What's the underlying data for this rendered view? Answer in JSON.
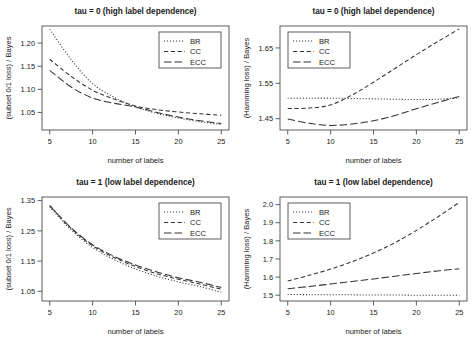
{
  "figure": {
    "series_names": [
      "BR",
      "CC",
      "ECC"
    ],
    "line_styles": {
      "BR": "dotted",
      "CC": "dashed",
      "ECC": "longdash"
    },
    "stroke_color": "#333333",
    "axis_color": "#4d4d4d",
    "background": "#ffffff"
  },
  "chart_data": [
    {
      "id": "panel-tl",
      "type": "line",
      "title": "tau = 0 (high label dependence)",
      "xlabel": "number of labels",
      "ylabel": "(subset 0/1 loss) / Bayes",
      "x": [
        5,
        7.5,
        10,
        12.5,
        15,
        17.5,
        20,
        22.5,
        25
      ],
      "xlim": [
        4.1,
        25.9
      ],
      "ylim": [
        1.012,
        1.237
      ],
      "xticks": [
        5,
        10,
        15,
        20,
        25
      ],
      "yticks": [
        1.05,
        1.1,
        1.15,
        1.2
      ],
      "ytick_labels": [
        "1.05",
        "1.10",
        "1.15",
        "1.20"
      ],
      "grid": false,
      "legend_position": "top-right",
      "series": [
        {
          "name": "BR",
          "values": [
            1.23,
            1.164,
            1.112,
            1.083,
            1.062,
            1.048,
            1.038,
            1.03,
            1.024
          ]
        },
        {
          "name": "CC",
          "values": [
            1.165,
            1.128,
            1.098,
            1.079,
            1.064,
            1.056,
            1.051,
            1.047,
            1.044
          ]
        },
        {
          "name": "ECC",
          "values": [
            1.141,
            1.105,
            1.081,
            1.07,
            1.062,
            1.05,
            1.04,
            1.032,
            1.026
          ]
        }
      ]
    },
    {
      "id": "panel-tr",
      "type": "line",
      "title": "tau = 0 (high label dependence)",
      "xlabel": "number of labels",
      "ylabel": "(Hamming loss) / Bayes",
      "x": [
        5,
        7.5,
        10,
        12.5,
        15,
        17.5,
        20,
        22.5,
        25
      ],
      "xlim": [
        4.1,
        25.9
      ],
      "ylim": [
        1.418,
        1.712
      ],
      "xticks": [
        5,
        10,
        15,
        20,
        25
      ],
      "yticks": [
        1.45,
        1.55,
        1.65
      ],
      "ytick_labels": [
        "1.45",
        "1.55",
        "1.65"
      ],
      "grid": false,
      "legend_position": "top-left",
      "series": [
        {
          "name": "BR",
          "values": [
            1.508,
            1.508,
            1.508,
            1.507,
            1.506,
            1.505,
            1.504,
            1.505,
            1.509
          ]
        },
        {
          "name": "CC",
          "values": [
            1.479,
            1.48,
            1.489,
            1.517,
            1.553,
            1.592,
            1.631,
            1.668,
            1.704
          ]
        },
        {
          "name": "ECC",
          "values": [
            1.449,
            1.437,
            1.431,
            1.435,
            1.444,
            1.459,
            1.478,
            1.496,
            1.513
          ]
        }
      ]
    },
    {
      "id": "panel-bl",
      "type": "line",
      "title": "tau = 1 (low label dependence)",
      "xlabel": "number of labels",
      "ylabel": "(subset 0/1 loss) / Bayes",
      "x": [
        5,
        7.5,
        10,
        12.5,
        15,
        17.5,
        20,
        22.5,
        25
      ],
      "xlim": [
        4.1,
        25.9
      ],
      "ylim": [
        1.018,
        1.362
      ],
      "xticks": [
        5,
        10,
        15,
        20,
        25
      ],
      "yticks": [
        1.05,
        1.15,
        1.25,
        1.35
      ],
      "ytick_labels": [
        "1.05",
        "1.15",
        "1.25",
        "1.35"
      ],
      "grid": false,
      "legend_position": "top-right",
      "series": [
        {
          "name": "BR",
          "values": [
            1.328,
            1.253,
            1.195,
            1.155,
            1.124,
            1.1,
            1.081,
            1.066,
            1.047
          ]
        },
        {
          "name": "CC",
          "values": [
            1.334,
            1.258,
            1.201,
            1.162,
            1.132,
            1.108,
            1.09,
            1.074,
            1.057
          ]
        },
        {
          "name": "ECC",
          "values": [
            1.333,
            1.26,
            1.204,
            1.166,
            1.137,
            1.114,
            1.095,
            1.08,
            1.063
          ]
        }
      ]
    },
    {
      "id": "panel-br",
      "type": "line",
      "title": "tau = 1 (low label dependence)",
      "xlabel": "number of labels",
      "ylabel": "(Hamming loss) / Bayes",
      "x": [
        5,
        7.5,
        10,
        12.5,
        15,
        17.5,
        20,
        22.5,
        25
      ],
      "xlim": [
        4.1,
        25.9
      ],
      "ylim": [
        1.468,
        2.042
      ],
      "xticks": [
        5,
        10,
        15,
        20,
        25
      ],
      "yticks": [
        1.5,
        1.6,
        1.7,
        1.8,
        1.9,
        2.0
      ],
      "ytick_labels": [
        "1.5",
        "1.6",
        "1.7",
        "1.8",
        "1.9",
        "2.0"
      ],
      "grid": false,
      "legend_position": "top-left",
      "series": [
        {
          "name": "BR",
          "values": [
            1.504,
            1.503,
            1.502,
            1.502,
            1.501,
            1.501,
            1.5,
            1.5,
            1.5
          ]
        },
        {
          "name": "CC",
          "values": [
            1.578,
            1.61,
            1.644,
            1.685,
            1.733,
            1.79,
            1.858,
            1.932,
            2.012
          ]
        },
        {
          "name": "ECC",
          "values": [
            1.536,
            1.548,
            1.562,
            1.576,
            1.59,
            1.605,
            1.62,
            1.634,
            1.646
          ]
        }
      ]
    }
  ]
}
